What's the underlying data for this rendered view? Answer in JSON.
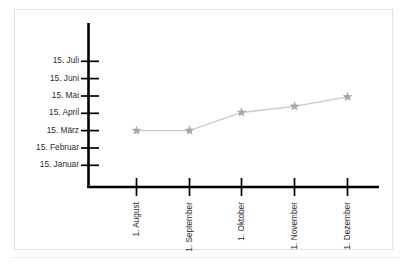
{
  "chart_data": {
    "type": "line",
    "title": "",
    "subtitle": "",
    "xlabel": "",
    "ylabel": "",
    "legend": [],
    "grid": false,
    "x_categories": [
      "1. August",
      "1. September",
      "1. Oktober",
      "1. November",
      "1. Dezember"
    ],
    "y_ticks": [
      "15. Januar",
      "15. Februar",
      "15. März",
      "15. April",
      "15. Mai",
      "15. Juni",
      "15. Juli"
    ],
    "y_tick_values": [
      0,
      1,
      2,
      3,
      4,
      5,
      6
    ],
    "ylim": [
      -0.6,
      6.6
    ],
    "series": [
      {
        "name": "",
        "marker": "star",
        "color": "#a8a8a8",
        "line_color": "#c8c8c8",
        "x": [
          "1. August",
          "1. September",
          "1. Oktober",
          "1. November",
          "1. Dezember"
        ],
        "values": [
          2.0,
          2.0,
          3.05,
          3.4,
          3.95
        ],
        "value_labels": [
          "15. März",
          "15. März",
          "ca. 17. April",
          "ca. 28. April",
          "ca. 10. Mai"
        ]
      }
    ],
    "axis_color": "#000000",
    "frame_color": "#e2e2e2",
    "background": "#ffffff"
  }
}
